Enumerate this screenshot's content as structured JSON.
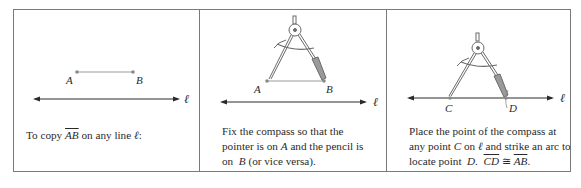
{
  "figure": {
    "panels": [
      {
        "id": "step-1",
        "points": [
          {
            "label": "A"
          },
          {
            "label": "B"
          }
        ],
        "line_label": "ℓ",
        "caption": {
          "prefix": "To copy ",
          "segment": "AB",
          "middle": " on any line ",
          "line": "ℓ",
          "suffix": ":"
        }
      },
      {
        "id": "step-2",
        "points": [
          {
            "label": "A"
          },
          {
            "label": "B"
          }
        ],
        "line_label": "ℓ",
        "caption": {
          "line1": "Fix the compass so that the",
          "line2_prefix": "pointer is on ",
          "line2_point": "A",
          "line2_suffix": " and the pencil is",
          "line3_prefix": "on  ",
          "line3_point": "B",
          "line3_suffix": " (or vice versa)."
        }
      },
      {
        "id": "step-3",
        "points": [
          {
            "label": "C"
          },
          {
            "label": "D"
          }
        ],
        "line_label": "ℓ",
        "caption": {
          "line1": "Place the point of the compass at",
          "line2_prefix": "any point ",
          "line2_point": "C",
          "line2_middle": " on ",
          "line2_line": "ℓ",
          "line2_suffix": " and strike an arc to",
          "line3_prefix": "locate point  ",
          "line3_point": "D.",
          "line3_space": "  ",
          "seg1": "CD",
          "congruent": " ≅ ",
          "seg2": "AB",
          "line3_suffix": "."
        }
      }
    ],
    "colors": {
      "frame": "#7a7a7a",
      "segment": "#9a9a9a",
      "line": "#2a2a2a",
      "compass": "#777777"
    }
  }
}
